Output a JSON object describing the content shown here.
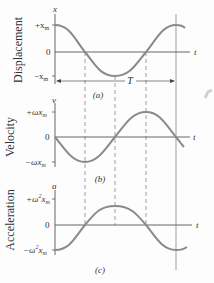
{
  "figure": {
    "colors": {
      "curve": "#8a8a8a",
      "axis": "#555555",
      "text": "#333333",
      "dash": "#777777",
      "mark": "#c8c8c8"
    },
    "panels": [
      {
        "id": "a",
        "ylabel": "Displacement",
        "axis_symbol": "x",
        "tick_top": "+x",
        "tick_top_sub": "m",
        "tick_zero": "0",
        "tick_bottom": "−x",
        "tick_bottom_sub": "m",
        "t_label": "t",
        "caption": "(a)",
        "period_label": "T"
      },
      {
        "id": "b",
        "ylabel": "Velocity",
        "axis_symbol": "v",
        "tick_top": "+ωx",
        "tick_top_sub": "m",
        "tick_zero": "0",
        "tick_bottom": "−ωx",
        "tick_bottom_sub": "m",
        "t_label": "t",
        "caption": "(b)"
      },
      {
        "id": "c",
        "ylabel": "Acceleration",
        "axis_symbol": "a",
        "tick_top": "+ω",
        "tick_top_sup": "2",
        "tick_top_tail": "x",
        "tick_top_sub": "m",
        "tick_zero": "0",
        "tick_bottom": "−ω",
        "tick_bottom_sup": "2",
        "tick_bottom_tail": "x",
        "tick_bottom_sub": "m",
        "t_label": "t",
        "caption": "(c)"
      }
    ]
  }
}
